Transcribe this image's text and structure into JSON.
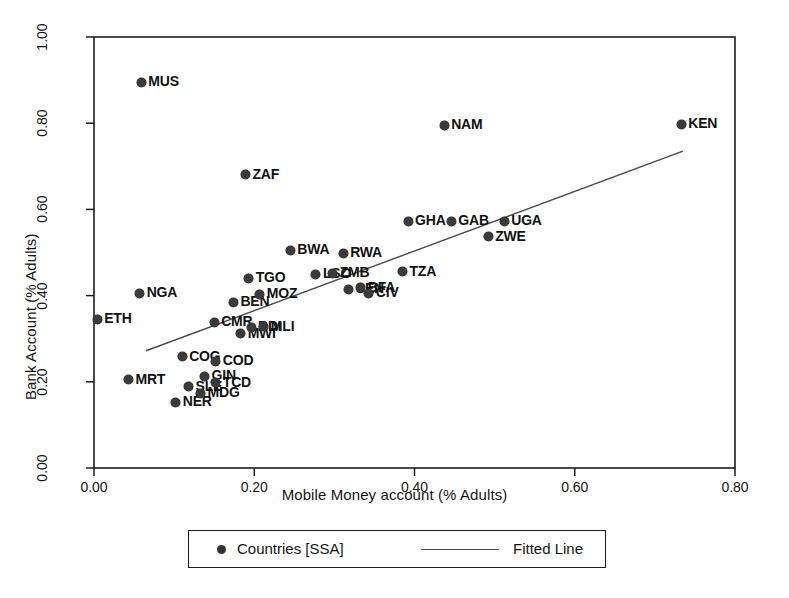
{
  "chart_data": {
    "type": "scatter",
    "title": "",
    "xlabel": "Mobile Money account (% Adults)",
    "ylabel": "Bank Account (% Adults)",
    "xlim": [
      0.0,
      0.8
    ],
    "ylim": [
      0.0,
      1.0
    ],
    "xticks": [
      "0.00",
      "0.20",
      "0.40",
      "0.60",
      "0.80"
    ],
    "xtick_values": [
      0.0,
      0.2,
      0.4,
      0.6,
      0.8
    ],
    "yticks": [
      "0.00",
      "0.20",
      "0.40",
      "0.60",
      "0.80",
      "1.00"
    ],
    "ytick_values": [
      0.0,
      0.2,
      0.4,
      0.6,
      0.8,
      1.0
    ],
    "grid": false,
    "legend_position": "below-axes",
    "marker_color": "#3b3b3b",
    "line_color": "#4a4a4a",
    "legend": [
      {
        "label": "Countries [SSA]",
        "marker": "circle"
      },
      {
        "label": "Fitted Line",
        "marker": "line"
      }
    ],
    "fitted_line": {
      "label": "Fitted Line",
      "x_start": 0.065,
      "y_start": 0.272,
      "x_end": 0.735,
      "y_end": 0.735
    },
    "series_name": "Countries [SSA]",
    "points": [
      {
        "label": "ETH",
        "x": 0.004,
        "y": 0.345,
        "label_side": "right"
      },
      {
        "label": "MRT",
        "x": 0.043,
        "y": 0.205,
        "label_side": "right"
      },
      {
        "label": "NGA",
        "x": 0.057,
        "y": 0.405,
        "label_side": "right"
      },
      {
        "label": "MUS",
        "x": 0.059,
        "y": 0.895,
        "label_side": "right"
      },
      {
        "label": "NER",
        "x": 0.102,
        "y": 0.153,
        "label_side": "right"
      },
      {
        "label": "COG",
        "x": 0.11,
        "y": 0.258,
        "label_side": "right"
      },
      {
        "label": "SLE",
        "x": 0.118,
        "y": 0.188,
        "label_side": "right"
      },
      {
        "label": "MDG",
        "x": 0.133,
        "y": 0.173,
        "label_side": "right"
      },
      {
        "label": "GIN",
        "x": 0.138,
        "y": 0.213,
        "label_side": "right"
      },
      {
        "label": "COD",
        "x": 0.152,
        "y": 0.248,
        "label_side": "right"
      },
      {
        "label": "TCD",
        "x": 0.152,
        "y": 0.198,
        "label_side": "right"
      },
      {
        "label": "CMR",
        "x": 0.15,
        "y": 0.338,
        "label_side": "right"
      },
      {
        "label": "BEN",
        "x": 0.174,
        "y": 0.385,
        "label_side": "right"
      },
      {
        "label": "MWI",
        "x": 0.183,
        "y": 0.312,
        "label_side": "right"
      },
      {
        "label": "ZAF",
        "x": 0.189,
        "y": 0.68,
        "label_side": "right"
      },
      {
        "label": "BDI",
        "x": 0.196,
        "y": 0.327,
        "label_side": "right"
      },
      {
        "label": "TGO",
        "x": 0.193,
        "y": 0.44,
        "label_side": "right"
      },
      {
        "label": "MLI",
        "x": 0.212,
        "y": 0.328,
        "label_side": "right"
      },
      {
        "label": "MOZ",
        "x": 0.207,
        "y": 0.403,
        "label_side": "right"
      },
      {
        "label": "BWA",
        "x": 0.245,
        "y": 0.505,
        "label_side": "right"
      },
      {
        "label": "LSO",
        "x": 0.277,
        "y": 0.45,
        "label_side": "right"
      },
      {
        "label": "ZMB",
        "x": 0.298,
        "y": 0.452,
        "label_side": "right"
      },
      {
        "label": "RWA",
        "x": 0.311,
        "y": 0.498,
        "label_side": "right"
      },
      {
        "label": "SEN",
        "x": 0.318,
        "y": 0.415,
        "label_side": "right"
      },
      {
        "label": "BFA",
        "x": 0.333,
        "y": 0.418,
        "label_side": "right"
      },
      {
        "label": "CIV",
        "x": 0.343,
        "y": 0.405,
        "label_side": "right"
      },
      {
        "label": "TZA",
        "x": 0.385,
        "y": 0.455,
        "label_side": "right"
      },
      {
        "label": "GHA",
        "x": 0.392,
        "y": 0.572,
        "label_side": "right"
      },
      {
        "label": "NAM",
        "x": 0.437,
        "y": 0.795,
        "label_side": "right"
      },
      {
        "label": "GAB",
        "x": 0.446,
        "y": 0.572,
        "label_side": "right"
      },
      {
        "label": "ZWE",
        "x": 0.492,
        "y": 0.537,
        "label_side": "right"
      },
      {
        "label": "UGA",
        "x": 0.512,
        "y": 0.572,
        "label_side": "right"
      },
      {
        "label": "KEN",
        "x": 0.733,
        "y": 0.797,
        "label_side": "right"
      }
    ]
  }
}
